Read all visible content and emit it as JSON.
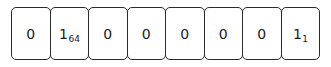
{
  "diagram": {
    "kind": "bit-field",
    "title": "",
    "cell_count": 8,
    "border_color": "#2b2b2b",
    "cell_background": "#ffffff",
    "text_color": "#1a1a1a",
    "cells": [
      {
        "value": "0",
        "subscript": ""
      },
      {
        "value": "1",
        "subscript": "64"
      },
      {
        "value": "0",
        "subscript": ""
      },
      {
        "value": "0",
        "subscript": ""
      },
      {
        "value": "0",
        "subscript": ""
      },
      {
        "value": "0",
        "subscript": ""
      },
      {
        "value": "0",
        "subscript": ""
      },
      {
        "value": "1",
        "subscript": "1"
      }
    ]
  }
}
